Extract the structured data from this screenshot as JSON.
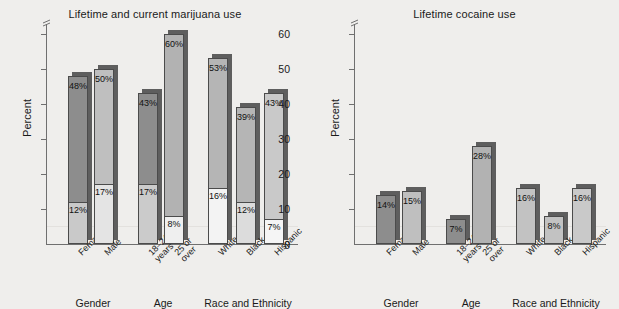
{
  "figure": {
    "background": "#efeeec",
    "axis_color": "#6f6f6f"
  },
  "panels": [
    {
      "id": "marijuana",
      "title": "Lifetime and current marijuana use",
      "ylabel": "Percent",
      "axis_break_marker": "axis-break-icon",
      "yticks": [
        "0",
        "10",
        "20",
        "30",
        "40",
        "50",
        "60"
      ],
      "groups": [
        {
          "label": "Gender",
          "categories": [
            "Female",
            "Male"
          ],
          "bars": [
            {
              "category": "Female",
              "lifetime": 48,
              "current": 12,
              "lifetime_label": "48%",
              "current_label": "12%",
              "color": "#8d8d8d",
              "lower_color": "#c9c9c9"
            },
            {
              "category": "Male",
              "lifetime": 50,
              "current": 17,
              "lifetime_label": "50%",
              "current_label": "17%",
              "color": "#bfbfbf",
              "lower_color": "#e4e4e4"
            }
          ]
        },
        {
          "label": "Age",
          "categories": [
            "18–24\nyears",
            "25 or\nover"
          ],
          "bars": [
            {
              "category": "18–24 years",
              "lifetime": 43,
              "current": 17,
              "lifetime_label": "43%",
              "current_label": "17%",
              "color": "#8d8d8d",
              "lower_color": "#cbcbcb"
            },
            {
              "category": "25 or over",
              "lifetime": 60,
              "current": 8,
              "lifetime_label": "60%",
              "current_label": "8%",
              "color": "#b2b2b2",
              "lower_color": "#efefef"
            }
          ]
        },
        {
          "label": "Race and Ethnicity",
          "categories": [
            "White",
            "Black",
            "Hispanic"
          ],
          "bars": [
            {
              "category": "White",
              "lifetime": 53,
              "current": 16,
              "lifetime_label": "53%",
              "current_label": "16%",
              "color": "#b5b5b5",
              "lower_color": "#f3f3f3"
            },
            {
              "category": "Black",
              "lifetime": 39,
              "current": 12,
              "lifetime_label": "39%",
              "current_label": "12%",
              "color": "#b5b5b5",
              "lower_color": "#dcdcdc"
            },
            {
              "category": "Hispanic",
              "lifetime": 43,
              "current": 7,
              "lifetime_label": "43%",
              "current_label": "7%",
              "color": "#c9c9c9",
              "lower_color": "#f5f5f5"
            }
          ]
        }
      ]
    },
    {
      "id": "cocaine",
      "title": "Lifetime cocaine use",
      "ylabel": "Percent",
      "axis_break_marker": "axis-break-icon",
      "yticks": [
        "0",
        "10",
        "20",
        "30",
        "40",
        "50",
        "60"
      ],
      "groups": [
        {
          "label": "Gender",
          "categories": [
            "Female",
            "Male"
          ],
          "bars": [
            {
              "category": "Female",
              "lifetime": 14,
              "current": 0,
              "lifetime_label": "14%",
              "current_label": "",
              "color": "#8d8d8d",
              "lower_color": ""
            },
            {
              "category": "Male",
              "lifetime": 15,
              "current": 0,
              "lifetime_label": "15%",
              "current_label": "",
              "color": "#bfbfbf",
              "lower_color": ""
            }
          ]
        },
        {
          "label": "Age",
          "categories": [
            "18–24\nyears",
            "25 or\nover"
          ],
          "bars": [
            {
              "category": "18–24 years",
              "lifetime": 7,
              "current": 0,
              "lifetime_label": "7%",
              "current_label": "",
              "color": "#8d8d8d",
              "lower_color": ""
            },
            {
              "category": "25 or over",
              "lifetime": 28,
              "current": 0,
              "lifetime_label": "28%",
              "current_label": "",
              "color": "#b2b2b2",
              "lower_color": ""
            }
          ]
        },
        {
          "label": "Race and Ethnicity",
          "categories": [
            "White",
            "Black",
            "Hispanic"
          ],
          "bars": [
            {
              "category": "White",
              "lifetime": 16,
              "current": 0,
              "lifetime_label": "16%",
              "current_label": "",
              "color": "#c2c2c2",
              "lower_color": ""
            },
            {
              "category": "Black",
              "lifetime": 8,
              "current": 0,
              "lifetime_label": "8%",
              "current_label": "",
              "color": "#c2c2c2",
              "lower_color": ""
            },
            {
              "category": "Hispanic",
              "lifetime": 16,
              "current": 0,
              "lifetime_label": "16%",
              "current_label": "",
              "color": "#c9c9c9",
              "lower_color": ""
            }
          ]
        }
      ]
    }
  ],
  "chart_data": [
    {
      "type": "bar",
      "title": "Lifetime and current marijuana use",
      "xlabel": "",
      "ylabel": "Percent",
      "ylim": [
        0,
        63
      ],
      "yticks": [
        0,
        10,
        20,
        30,
        40,
        50,
        60
      ],
      "grid": false,
      "legend": "none",
      "axis_break": true,
      "groups": [
        "Gender",
        "Age",
        "Race and Ethnicity"
      ],
      "categories": [
        "Female",
        "Male",
        "18–24 years",
        "25 or over",
        "White",
        "Black",
        "Hispanic"
      ],
      "series": [
        {
          "name": "Lifetime use",
          "values": [
            48,
            50,
            43,
            60,
            53,
            39,
            43
          ]
        },
        {
          "name": "Current use",
          "values": [
            12,
            17,
            17,
            8,
            16,
            12,
            7
          ]
        }
      ],
      "data_labels": {
        "lifetime": [
          "48%",
          "50%",
          "43%",
          "60%",
          "53%",
          "39%",
          "43%"
        ],
        "current": [
          "12%",
          "17%",
          "17%",
          "8%",
          "16%",
          "12%",
          "7%"
        ]
      }
    },
    {
      "type": "bar",
      "title": "Lifetime cocaine use",
      "xlabel": "",
      "ylabel": "Percent",
      "ylim": [
        0,
        63
      ],
      "yticks": [
        0,
        10,
        20,
        30,
        40,
        50,
        60
      ],
      "grid": false,
      "legend": "none",
      "axis_break": true,
      "groups": [
        "Gender",
        "Age",
        "Race and Ethnicity"
      ],
      "categories": [
        "Female",
        "Male",
        "18–24 years",
        "25 or over",
        "White",
        "Black",
        "Hispanic"
      ],
      "series": [
        {
          "name": "Lifetime use",
          "values": [
            14,
            15,
            7,
            28,
            16,
            8,
            16
          ]
        }
      ],
      "data_labels": {
        "lifetime": [
          "14%",
          "15%",
          "7%",
          "28%",
          "16%",
          "8%",
          "16%"
        ]
      }
    }
  ]
}
